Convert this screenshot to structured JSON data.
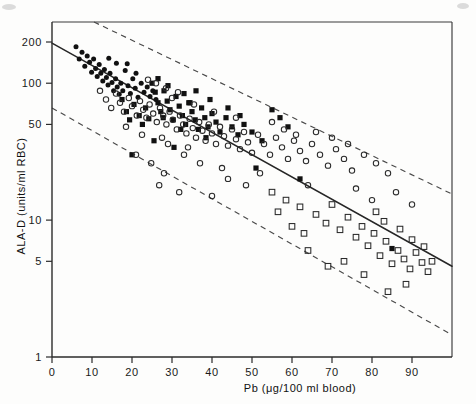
{
  "figure": {
    "background_color": "#fdfdfc",
    "ink_color": "#111111"
  },
  "chart_data": {
    "type": "scatter",
    "title": "",
    "subtitle": "",
    "xlabel": "Pb (μg/100 ml  blood)",
    "ylabel": "ALA-D (units/ml RBC)",
    "yscale": "log",
    "xscale": "linear",
    "xlim": [
      0,
      100
    ],
    "ylim": [
      1,
      280
    ],
    "xticks": [
      0,
      10,
      20,
      30,
      40,
      50,
      60,
      70,
      80,
      90
    ],
    "xtick_labels": [
      "0",
      "10",
      "20",
      "30",
      "40",
      "50",
      "60",
      "70",
      "80",
      "90"
    ],
    "yticks": [
      1,
      5,
      10,
      50,
      100,
      200
    ],
    "ytick_labels": [
      "1",
      "5",
      "10",
      "50",
      "100",
      "200"
    ],
    "grid": false,
    "legend": false,
    "legend_position": "none",
    "annotations": [],
    "fit_line": {
      "name": "regression line",
      "style": "solid",
      "x_start": 0.0,
      "y_start": 196.0,
      "x_end": 100.0,
      "y_end": 4.6
    },
    "bands": [
      {
        "name": "upper confidence band",
        "style": "dashed",
        "x_start": 10.5,
        "y_start": 280.0,
        "x_end": 100.0,
        "y_end": 15.5
      },
      {
        "name": "lower confidence band",
        "style": "dashed",
        "x_start": 0.0,
        "y_start": 66.0,
        "x_end": 100.0,
        "y_end": 1.45
      }
    ],
    "series": [
      {
        "name": "filled-circle group",
        "marker": "filled-circle",
        "points": [
          [
            6.0,
            185.0
          ],
          [
            6.8,
            150.0
          ],
          [
            7.5,
            168.0
          ],
          [
            8.2,
            133.0
          ],
          [
            8.8,
            158.0
          ],
          [
            9.4,
            142.0
          ],
          [
            9.9,
            120.0
          ],
          [
            10.4,
            150.0
          ],
          [
            10.9,
            128.0
          ],
          [
            11.3,
            112.0
          ],
          [
            11.8,
            137.0
          ],
          [
            12.2,
            118.0
          ],
          [
            12.7,
            104.0
          ],
          [
            13.1,
            126.0
          ],
          [
            13.6,
            110.0
          ],
          [
            14.0,
            97.0
          ],
          [
            14.5,
            118.0
          ],
          [
            15.0,
            101.0
          ],
          [
            15.4,
            88.0
          ],
          [
            15.9,
            108.0
          ],
          [
            16.3,
            94.0
          ],
          [
            16.8,
            83.0
          ],
          [
            17.2,
            100.0
          ],
          [
            17.7,
            88.0
          ],
          [
            14.2,
            152.0
          ],
          [
            16.1,
            140.0
          ],
          [
            18.3,
            124.0
          ],
          [
            19.0,
            96.0
          ],
          [
            19.6,
            84.0
          ],
          [
            20.2,
            108.0
          ],
          [
            20.8,
            92.0
          ],
          [
            21.5,
            79.0
          ],
          [
            18.8,
            139.0
          ],
          [
            21.0,
            118.0
          ],
          [
            22.3,
            100.0
          ],
          [
            23.0,
            86.0
          ],
          [
            23.8,
            94.0
          ],
          [
            24.5,
            80.0
          ],
          [
            25.2,
            88.0
          ],
          [
            26.0,
            76.0
          ]
        ]
      },
      {
        "name": "filled-square group",
        "marker": "filled-square",
        "points": [
          [
            17.5,
            76.0
          ],
          [
            18.6,
            62.0
          ],
          [
            19.4,
            54.0
          ],
          [
            20.5,
            70.0
          ],
          [
            21.8,
            58.0
          ],
          [
            22.6,
            50.0
          ],
          [
            23.4,
            66.0
          ],
          [
            24.2,
            55.0
          ],
          [
            25.0,
            100.0
          ],
          [
            25.8,
            86.0
          ],
          [
            26.5,
            72.0
          ],
          [
            27.2,
            62.0
          ],
          [
            28.0,
            88.0
          ],
          [
            28.8,
            74.0
          ],
          [
            29.5,
            64.0
          ],
          [
            30.3,
            54.0
          ],
          [
            31.0,
            80.0
          ],
          [
            31.8,
            68.0
          ],
          [
            32.6,
            58.0
          ],
          [
            33.4,
            50.0
          ],
          [
            34.2,
            72.0
          ],
          [
            35.0,
            62.0
          ],
          [
            35.8,
            54.0
          ],
          [
            36.6,
            46.0
          ],
          [
            37.4,
            66.0
          ],
          [
            38.2,
            56.0
          ],
          [
            39.0,
            48.0
          ],
          [
            40.0,
            60.0
          ],
          [
            41.0,
            52.0
          ],
          [
            42.0,
            44.0
          ],
          [
            43.5,
            56.0
          ],
          [
            45.0,
            48.0
          ],
          [
            46.5,
            42.0
          ],
          [
            26.5,
            108.0
          ],
          [
            29.0,
            96.0
          ],
          [
            33.0,
            84.0
          ],
          [
            20.0,
            30.0
          ],
          [
            25.5,
            38.0
          ],
          [
            30.5,
            34.0
          ],
          [
            38.5,
            40.0
          ],
          [
            48.0,
            50.0
          ],
          [
            50.0,
            44.0
          ],
          [
            52.5,
            38.0
          ],
          [
            55.0,
            64.0
          ],
          [
            57.0,
            56.0
          ],
          [
            59.0,
            48.0
          ],
          [
            51.0,
            24.0
          ],
          [
            62.0,
            20.0
          ],
          [
            85.0,
            6.2
          ],
          [
            44.0,
            66.0
          ],
          [
            47.0,
            58.0
          ],
          [
            36.0,
            88.0
          ],
          [
            34.5,
            72.0
          ],
          [
            39.5,
            76.0
          ],
          [
            27.8,
            56.0
          ],
          [
            32.2,
            46.0
          ]
        ]
      },
      {
        "name": "open-circle group",
        "marker": "open-circle",
        "points": [
          [
            12.0,
            88.0
          ],
          [
            13.5,
            76.0
          ],
          [
            14.8,
            66.0
          ],
          [
            16.0,
            84.0
          ],
          [
            17.0,
            72.0
          ],
          [
            18.0,
            62.0
          ],
          [
            19.2,
            78.0
          ],
          [
            20.0,
            68.0
          ],
          [
            21.2,
            58.0
          ],
          [
            22.0,
            74.0
          ],
          [
            22.8,
            64.0
          ],
          [
            23.6,
            56.0
          ],
          [
            24.4,
            70.0
          ],
          [
            25.3,
            60.0
          ],
          [
            26.2,
            52.0
          ],
          [
            27.0,
            66.0
          ],
          [
            27.8,
            58.0
          ],
          [
            28.6,
            50.0
          ],
          [
            29.4,
            62.0
          ],
          [
            30.2,
            54.0
          ],
          [
            31.2,
            46.0
          ],
          [
            32.0,
            58.0
          ],
          [
            32.8,
            50.0
          ],
          [
            33.6,
            43.0
          ],
          [
            34.4,
            55.0
          ],
          [
            35.2,
            47.0
          ],
          [
            36.0,
            40.0
          ],
          [
            36.8,
            52.0
          ],
          [
            37.6,
            45.0
          ],
          [
            38.4,
            38.0
          ],
          [
            39.2,
            50.0
          ],
          [
            40.0,
            43.0
          ],
          [
            41.0,
            36.0
          ],
          [
            42.0,
            48.0
          ],
          [
            43.0,
            41.0
          ],
          [
            44.0,
            35.0
          ],
          [
            45.0,
            46.0
          ],
          [
            46.0,
            39.0
          ],
          [
            47.0,
            33.0
          ],
          [
            48.0,
            44.0
          ],
          [
            49.0,
            37.0
          ],
          [
            50.0,
            31.0
          ],
          [
            51.5,
            42.0
          ],
          [
            53.0,
            36.0
          ],
          [
            54.5,
            30.0
          ],
          [
            56.0,
            40.0
          ],
          [
            57.5,
            34.0
          ],
          [
            59.0,
            28.0
          ],
          [
            60.5,
            38.0
          ],
          [
            62.0,
            32.0
          ],
          [
            63.5,
            27.0
          ],
          [
            65.0,
            36.0
          ],
          [
            67.0,
            30.0
          ],
          [
            69.0,
            25.0
          ],
          [
            71.0,
            33.0
          ],
          [
            73.0,
            28.0
          ],
          [
            75.0,
            23.0
          ],
          [
            78.0,
            30.0
          ],
          [
            81.0,
            26.0
          ],
          [
            84.0,
            22.0
          ],
          [
            26.0,
            100.0
          ],
          [
            28.5,
            92.0
          ],
          [
            31.5,
            86.0
          ],
          [
            24.0,
            106.0
          ],
          [
            30.0,
            78.0
          ],
          [
            35.5,
            70.0
          ],
          [
            40.5,
            62.0
          ],
          [
            46.0,
            56.0
          ],
          [
            29.0,
            36.0
          ],
          [
            33.0,
            30.0
          ],
          [
            37.0,
            26.0
          ],
          [
            42.5,
            24.0
          ],
          [
            21.0,
            30.0
          ],
          [
            24.8,
            26.0
          ],
          [
            28.0,
            22.0
          ],
          [
            44.0,
            20.0
          ],
          [
            48.5,
            18.0
          ],
          [
            26.8,
            18.0
          ],
          [
            31.8,
            16.0
          ],
          [
            40.0,
            15.0
          ],
          [
            55.0,
            52.0
          ],
          [
            58.0,
            46.0
          ],
          [
            61.0,
            42.0
          ],
          [
            66.0,
            44.0
          ],
          [
            70.0,
            40.0
          ],
          [
            74.0,
            36.0
          ],
          [
            18.5,
            48.0
          ],
          [
            22.5,
            42.0
          ],
          [
            27.5,
            40.0
          ],
          [
            34.0,
            34.0
          ],
          [
            52.0,
            22.0
          ],
          [
            64.0,
            18.0
          ],
          [
            76.0,
            17.0
          ],
          [
            80.0,
            14.0
          ],
          [
            86.0,
            16.0
          ],
          [
            90.0,
            13.0
          ]
        ]
      },
      {
        "name": "open-square group",
        "marker": "open-square",
        "points": [
          [
            55.0,
            16.0
          ],
          [
            58.5,
            14.0
          ],
          [
            62.0,
            12.5
          ],
          [
            64.0,
            6.0
          ],
          [
            66.0,
            11.0
          ],
          [
            68.5,
            9.5
          ],
          [
            70.0,
            13.0
          ],
          [
            72.0,
            8.5
          ],
          [
            74.0,
            10.5
          ],
          [
            76.0,
            7.5
          ],
          [
            77.5,
            9.0
          ],
          [
            79.0,
            6.5
          ],
          [
            80.5,
            8.0
          ],
          [
            82.0,
            5.5
          ],
          [
            83.5,
            7.0
          ],
          [
            85.0,
            4.8
          ],
          [
            86.5,
            6.0
          ],
          [
            88.0,
            5.2
          ],
          [
            89.5,
            4.4
          ],
          [
            91.0,
            5.8
          ],
          [
            92.5,
            4.9
          ],
          [
            94.0,
            4.2
          ],
          [
            84.0,
            3.0
          ],
          [
            88.5,
            3.4
          ],
          [
            78.0,
            4.0
          ],
          [
            73.0,
            5.0
          ],
          [
            69.0,
            4.6
          ],
          [
            81.0,
            11.5
          ],
          [
            83.0,
            9.8
          ],
          [
            90.0,
            7.2
          ],
          [
            93.0,
            6.4
          ],
          [
            95.0,
            5.0
          ],
          [
            60.0,
            9.0
          ],
          [
            63.0,
            8.0
          ],
          [
            56.5,
            11.5
          ],
          [
            87.0,
            8.6
          ]
        ]
      }
    ]
  },
  "artifacts": {
    "top_left_mark": "scan-smudge",
    "top_right_mark": "scan-smudge"
  }
}
